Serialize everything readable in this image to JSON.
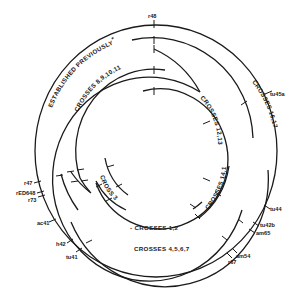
{
  "diagram": {
    "colors": {
      "line": "#1a1a1a",
      "background": "#ffffff"
    },
    "arc_labels": {
      "established": "ESTABLISHED PREVIOUSLY",
      "established_note": "*",
      "crosses_8_11": "CROSSES 8,9,10,11",
      "crosses_12_13": "CROSSES 12,13",
      "crosses_16_17": "CROSSES 16,17",
      "crosses_14_15": "CROSSES 14,15",
      "cross_3": "CROSS 3",
      "crosses_1_2": "- CROSSES 1,2",
      "crosses_4_7": "CROSSES 4,5,6,7"
    },
    "markers": {
      "r48": "r48",
      "tu45a": "tu45a",
      "r47": "r47",
      "rED648": "rED648",
      "r73": "r73",
      "ac41": "ac41",
      "h42": "h42",
      "tu41": "tu41",
      "tu44": "tu44",
      "tu42b": "tu42b",
      "am65": "am65",
      "am54": "am54",
      "r67": "r67"
    }
  }
}
